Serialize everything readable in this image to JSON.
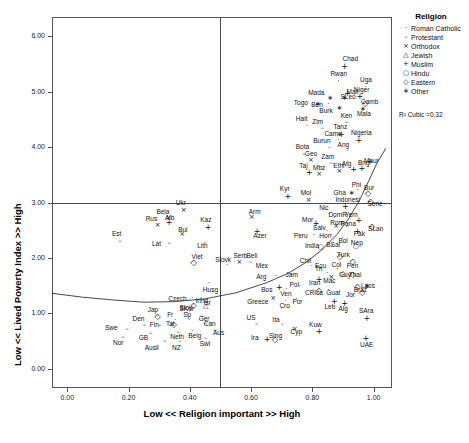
{
  "chart_data": {
    "type": "scatter",
    "title": "",
    "xlabel": "Low << Religion important >> High",
    "ylabel": "Low << Lived Poverty Index >> High",
    "xlim": [
      -0.05,
      1.06
    ],
    "ylim": [
      -0.35,
      6.35
    ],
    "xticks": [
      "0.00",
      "0.20",
      "0.40",
      "0.60",
      "0.80",
      "1.00"
    ],
    "xtickvals": [
      0.0,
      0.2,
      0.4,
      0.6,
      0.8,
      1.0
    ],
    "yticks": [
      "0.00",
      "1.00",
      "2.00",
      "3.00",
      "4.00",
      "5.00",
      "6.00"
    ],
    "ytickvals": [
      0.0,
      1.0,
      2.0,
      3.0,
      4.0,
      5.0,
      6.0
    ],
    "grid": false,
    "reference_lines": [
      {
        "axis": "y",
        "value": 3.0
      },
      {
        "axis": "x",
        "value": 0.5
      }
    ],
    "annotation": "R² Cubic =0.32",
    "fit": {
      "type": "cubic",
      "r2": 0.32
    },
    "legend": {
      "position": "top-right",
      "title": "Religion",
      "entries": [
        {
          "label": "Roman Catholic",
          "glyph": "·",
          "key": "catholic"
        },
        {
          "label": "Protestant",
          "glyph": "–",
          "key": "protestant"
        },
        {
          "label": "Orthodox",
          "glyph": "×",
          "key": "orthodox"
        },
        {
          "label": "Jewish",
          "glyph": "△",
          "key": "jewish"
        },
        {
          "label": "Muslim",
          "glyph": "+",
          "key": "muslim"
        },
        {
          "label": "Hindu",
          "glyph": "○",
          "key": "hindu"
        },
        {
          "label": "Eastern",
          "glyph": "◇",
          "key": "eastern"
        },
        {
          "label": "Other",
          "glyph": "∗",
          "key": "other"
        }
      ]
    },
    "points": [
      {
        "label": "Chad",
        "x": 0.905,
        "y": 5.46,
        "g": "muslim",
        "lx": 6,
        "ly": -8
      },
      {
        "label": "Rwan",
        "x": 0.885,
        "y": 5.19,
        "g": "catholic",
        "lx": 0,
        "ly": -8
      },
      {
        "label": "Uga",
        "x": 0.975,
        "y": 5.08,
        "g": "catholic",
        "lx": 2,
        "ly": -8
      },
      {
        "label": "Mali",
        "x": 0.915,
        "y": 4.97,
        "g": "muslim",
        "lx": 7,
        "ly": -2
      },
      {
        "label": "Niger",
        "x": 0.955,
        "y": 4.93,
        "g": "muslim",
        "lx": 2,
        "ly": -7
      },
      {
        "label": "Mada",
        "x": 0.858,
        "y": 4.88,
        "g": "other",
        "lx": -14,
        "ly": -6
      },
      {
        "label": "SLeo",
        "x": 0.905,
        "y": 4.88,
        "g": "other",
        "lx": 4,
        "ly": -2
      },
      {
        "label": "Togo",
        "x": 0.818,
        "y": 4.78,
        "g": "other",
        "lx": -16,
        "ly": -2
      },
      {
        "label": "Ben",
        "x": 0.852,
        "y": 4.78,
        "g": "catholic",
        "lx": -9,
        "ly": 0
      },
      {
        "label": "Camb",
        "x": 0.972,
        "y": 4.8,
        "g": "eastern",
        "lx": 4,
        "ly": -2
      },
      {
        "label": "Burk",
        "x": 0.888,
        "y": 4.7,
        "g": "other",
        "lx": -12,
        "ly": 2
      },
      {
        "label": "Mala",
        "x": 0.965,
        "y": 4.68,
        "g": "other",
        "lx": 2,
        "ly": 4
      },
      {
        "label": "Ken",
        "x": 0.912,
        "y": 4.45,
        "g": "protestant",
        "lx": 2,
        "ly": -7
      },
      {
        "label": "Hait",
        "x": 0.782,
        "y": 4.38,
        "g": "catholic",
        "lx": -3,
        "ly": -8
      },
      {
        "label": "Zim",
        "x": 0.832,
        "y": 4.34,
        "g": "protestant",
        "lx": -2,
        "ly": -7
      },
      {
        "label": "Tanz",
        "x": 0.895,
        "y": 4.23,
        "g": "muslim",
        "lx": 0,
        "ly": -8
      },
      {
        "label": "Came",
        "x": 0.885,
        "y": 4.12,
        "g": "catholic",
        "lx": -6,
        "ly": -7
      },
      {
        "label": "Nigeria",
        "x": 0.952,
        "y": 4.12,
        "g": "muslim",
        "lx": 0,
        "ly": -8
      },
      {
        "label": "Burun",
        "x": 0.855,
        "y": 3.98,
        "g": "catholic",
        "lx": -8,
        "ly": -8
      },
      {
        "label": "Ang",
        "x": 0.915,
        "y": 3.93,
        "g": "catholic",
        "lx": -2,
        "ly": -7
      },
      {
        "label": "Bota",
        "x": 0.772,
        "y": 3.88,
        "g": "protestant",
        "lx": 0,
        "ly": -8
      },
      {
        "label": "Geo",
        "x": 0.795,
        "y": 3.76,
        "g": "orthodox",
        "lx": 2,
        "ly": -7
      },
      {
        "label": "Zam",
        "x": 0.862,
        "y": 3.72,
        "g": "protestant",
        "lx": -2,
        "ly": -7
      },
      {
        "label": "Maur",
        "x": 0.988,
        "y": 3.75,
        "g": "muslim",
        "lx": 2,
        "ly": -1
      },
      {
        "label": "Taj",
        "x": 0.79,
        "y": 3.55,
        "g": "muslim",
        "lx": -2,
        "ly": -7
      },
      {
        "label": "Mbz",
        "x": 0.822,
        "y": 3.52,
        "g": "orthodox",
        "lx": 2,
        "ly": -7
      },
      {
        "label": "Ethi",
        "x": 0.888,
        "y": 3.57,
        "g": "orthodox",
        "lx": 2,
        "ly": -6
      },
      {
        "label": "Afg",
        "x": 0.935,
        "y": 3.6,
        "g": "muslim",
        "lx": -4,
        "ly": -6
      },
      {
        "label": "Bng",
        "x": 0.962,
        "y": 3.62,
        "g": "muslim",
        "lx": 4,
        "ly": -6
      },
      {
        "label": "Kyr",
        "x": 0.72,
        "y": 3.12,
        "g": "muslim",
        "lx": 0,
        "ly": -8
      },
      {
        "label": "Mol",
        "x": 0.788,
        "y": 3.04,
        "g": "orthodox",
        "lx": 0,
        "ly": -8
      },
      {
        "label": "Gha",
        "x": 0.928,
        "y": 3.18,
        "g": "other",
        "lx": -10,
        "ly": -1
      },
      {
        "label": "Phi",
        "x": 0.948,
        "y": 3.22,
        "g": "catholic",
        "lx": 2,
        "ly": -6
      },
      {
        "label": "Bur",
        "x": 0.982,
        "y": 3.18,
        "g": "eastern",
        "lx": 4,
        "ly": -6
      },
      {
        "label": "Sene",
        "x": 0.99,
        "y": 3.02,
        "g": "eastern",
        "lx": 5,
        "ly": 2
      },
      {
        "label": "Ukr",
        "x": 0.38,
        "y": 2.86,
        "g": "orthodox",
        "lx": 0,
        "ly": -8
      },
      {
        "label": "Arm",
        "x": 0.602,
        "y": 2.73,
        "g": "orthodox",
        "lx": 5,
        "ly": -6
      },
      {
        "label": "Indonesi",
        "x": 0.908,
        "y": 2.93,
        "g": "muslim",
        "lx": -2,
        "ly": -7
      },
      {
        "label": "Nic",
        "x": 0.855,
        "y": 2.8,
        "g": "catholic",
        "lx": -2,
        "ly": -7
      },
      {
        "label": "Bela",
        "x": 0.33,
        "y": 2.72,
        "g": "orthodox",
        "lx": -4,
        "ly": -7
      },
      {
        "label": "Rus",
        "x": 0.295,
        "y": 2.6,
        "g": "orthodox",
        "lx": -4,
        "ly": -7
      },
      {
        "label": "Alb",
        "x": 0.332,
        "y": 2.64,
        "g": "muslim",
        "lx": 4,
        "ly": -5
      },
      {
        "label": "DomR",
        "x": 0.872,
        "y": 2.72,
        "g": "catholic",
        "lx": 2,
        "ly": -4
      },
      {
        "label": "Yem",
        "x": 0.952,
        "y": 2.69,
        "g": "muslim",
        "lx": -6,
        "ly": -6
      },
      {
        "label": "Kaz",
        "x": 0.46,
        "y": 2.56,
        "g": "muslim",
        "lx": 0,
        "ly": -8
      },
      {
        "label": "Mor",
        "x": 0.812,
        "y": 2.63,
        "g": "muslim",
        "lx": -6,
        "ly": -4
      },
      {
        "label": "Rom",
        "x": 0.878,
        "y": 2.58,
        "g": "orthodox",
        "lx": 2,
        "ly": -4
      },
      {
        "label": "Pana",
        "x": 0.912,
        "y": 2.55,
        "g": "catholic",
        "lx": 2,
        "ly": -4
      },
      {
        "label": "Azer",
        "x": 0.62,
        "y": 2.49,
        "g": "muslim",
        "lx": 4,
        "ly": 4
      },
      {
        "label": "Bul",
        "x": 0.375,
        "y": 2.43,
        "g": "orthodox",
        "lx": 4,
        "ly": -5
      },
      {
        "label": "SLan",
        "x": 0.995,
        "y": 2.58,
        "g": "eastern",
        "lx": 4,
        "ly": 2
      },
      {
        "label": "Salv",
        "x": 0.848,
        "y": 2.48,
        "g": "catholic",
        "lx": -6,
        "ly": -4
      },
      {
        "label": "Pak",
        "x": 0.948,
        "y": 2.49,
        "g": "muslim",
        "lx": 4,
        "ly": 2
      },
      {
        "label": "Est",
        "x": 0.172,
        "y": 2.31,
        "g": "protestant",
        "lx": 0,
        "ly": -8
      },
      {
        "label": "Peru",
        "x": 0.805,
        "y": 2.42,
        "g": "catholic",
        "lx": -12,
        "ly": 0
      },
      {
        "label": "Hon",
        "x": 0.862,
        "y": 2.42,
        "g": "catholic",
        "lx": -4,
        "ly": 0
      },
      {
        "label": "Bol",
        "x": 0.898,
        "y": 2.36,
        "g": "catholic",
        "lx": 4,
        "ly": 2
      },
      {
        "label": "Lat",
        "x": 0.332,
        "y": 2.27,
        "g": "protestant",
        "lx": -9,
        "ly": 0
      },
      {
        "label": "Lith",
        "x": 0.45,
        "y": 2.27,
        "g": "catholic",
        "lx": 0,
        "ly": 2
      },
      {
        "label": "India",
        "x": 0.828,
        "y": 2.2,
        "g": "hindu",
        "lx": -8,
        "ly": -2
      },
      {
        "label": "BSal",
        "x": 0.865,
        "y": 2.22,
        "g": "catholic",
        "lx": 2,
        "ly": -2
      },
      {
        "label": "Nep",
        "x": 0.942,
        "y": 2.21,
        "g": "hindu",
        "lx": 3,
        "ly": -4
      },
      {
        "label": "Viet",
        "x": 0.412,
        "y": 1.92,
        "g": "eastern",
        "lx": 6,
        "ly": -6
      },
      {
        "label": "Turk",
        "x": 0.89,
        "y": 2.04,
        "g": "eastern",
        "lx": 5,
        "ly": -2
      },
      {
        "label": "Slovk",
        "x": 0.522,
        "y": 1.87,
        "g": "catholic",
        "lx": -4,
        "ly": -6
      },
      {
        "label": "Serb",
        "x": 0.562,
        "y": 1.92,
        "g": "orthodox",
        "lx": 2,
        "ly": -7
      },
      {
        "label": "Beli",
        "x": 0.598,
        "y": 1.92,
        "g": "protestant",
        "lx": 4,
        "ly": -7
      },
      {
        "label": "Pen",
        "x": 0.932,
        "y": 1.94,
        "g": "eastern",
        "lx": 2,
        "ly": 4
      },
      {
        "label": "Chil",
        "x": 0.798,
        "y": 1.85,
        "g": "catholic",
        "lx": -4,
        "ly": -6
      },
      {
        "label": "Ecu",
        "x": 0.828,
        "y": 1.8,
        "g": "catholic",
        "lx": 2,
        "ly": -4
      },
      {
        "label": "Mex",
        "x": 0.648,
        "y": 1.82,
        "g": "catholic",
        "lx": -2,
        "ly": -3
      },
      {
        "label": "Col",
        "x": 0.882,
        "y": 1.8,
        "g": "catholic",
        "lx": 2,
        "ly": -5
      },
      {
        "label": "Tri",
        "x": 0.848,
        "y": 1.72,
        "g": "catholic",
        "lx": -4,
        "ly": -5
      },
      {
        "label": "Mac",
        "x": 0.862,
        "y": 1.66,
        "g": "orthodox",
        "lx": 0,
        "ly": 3
      },
      {
        "label": "Guy",
        "x": 0.9,
        "y": 1.7,
        "g": "hindu",
        "lx": 4,
        "ly": 0
      },
      {
        "label": "Thai",
        "x": 0.932,
        "y": 1.7,
        "g": "eastern",
        "lx": 4,
        "ly": 0
      },
      {
        "label": "Arg",
        "x": 0.682,
        "y": 1.68,
        "g": "catholic",
        "lx": -12,
        "ly": 0
      },
      {
        "label": "Jam",
        "x": 0.732,
        "y": 1.7,
        "g": "protestant",
        "lx": 2,
        "ly": 0
      },
      {
        "label": "Iran",
        "x": 0.822,
        "y": 1.62,
        "g": "muslim",
        "lx": -2,
        "ly": 3
      },
      {
        "label": "Husg",
        "x": 0.462,
        "y": 1.55,
        "g": "catholic",
        "lx": 2,
        "ly": 6
      },
      {
        "label": "Bos",
        "x": 0.692,
        "y": 1.47,
        "g": "muslim",
        "lx": -10,
        "ly": 2
      },
      {
        "label": "Ven",
        "x": 0.715,
        "y": 1.44,
        "g": "catholic",
        "lx": 2,
        "ly": 4
      },
      {
        "label": "Pol",
        "x": 0.758,
        "y": 1.5,
        "g": "catholic",
        "lx": -2,
        "ly": -2
      },
      {
        "label": "Braz",
        "x": 0.948,
        "y": 1.5,
        "g": "eastern",
        "lx": 4,
        "ly": 3
      },
      {
        "label": "Laos",
        "x": 0.978,
        "y": 1.5,
        "g": "other",
        "lx": 2,
        "ly": -1
      },
      {
        "label": "CRica",
        "x": 0.822,
        "y": 1.42,
        "g": "eastern",
        "lx": -6,
        "ly": 2
      },
      {
        "label": "Guat",
        "x": 0.852,
        "y": 1.42,
        "g": "catholic",
        "lx": 6,
        "ly": 2
      },
      {
        "label": "Jor",
        "x": 0.962,
        "y": 1.38,
        "g": "eastern",
        "lx": -8,
        "ly": 2
      },
      {
        "label": "Czech",
        "x": 0.408,
        "y": 1.28,
        "g": "catholic",
        "lx": -16,
        "ly": 0
      },
      {
        "label": "Irlnd",
        "x": 0.438,
        "y": 1.28,
        "g": "catholic",
        "lx": 2,
        "ly": 2
      },
      {
        "label": "Greece",
        "x": 0.672,
        "y": 1.28,
        "g": "orthodox",
        "lx": -18,
        "ly": 3
      },
      {
        "label": "Cro",
        "x": 0.712,
        "y": 1.22,
        "g": "catholic",
        "lx": 2,
        "ly": 4
      },
      {
        "label": "Por",
        "x": 0.748,
        "y": 1.26,
        "g": "catholic",
        "lx": 4,
        "ly": 2
      },
      {
        "label": "Leb",
        "x": 0.872,
        "y": 1.22,
        "g": "muslim",
        "lx": -2,
        "ly": 5
      },
      {
        "label": "Alg",
        "x": 0.905,
        "y": 1.18,
        "g": "muslim",
        "lx": 2,
        "ly": 5
      },
      {
        "label": "SKor",
        "x": 0.412,
        "y": 1.15,
        "g": "eastern",
        "lx": -6,
        "ly": 3
      },
      {
        "label": "Isr",
        "x": 0.452,
        "y": 1.13,
        "g": "jewish",
        "lx": 6,
        "ly": -4
      },
      {
        "label": "Jap",
        "x": 0.295,
        "y": 0.95,
        "g": "eastern",
        "lx": -2,
        "ly": -7
      },
      {
        "label": "Slov",
        "x": 0.392,
        "y": 1.0,
        "g": "catholic",
        "lx": 0,
        "ly": -6
      },
      {
        "label": "Ger",
        "x": 0.442,
        "y": 0.95,
        "g": "protestant",
        "lx": 4,
        "ly": 2
      },
      {
        "label": "Fr",
        "x": 0.352,
        "y": 0.88,
        "g": "catholic",
        "lx": 0,
        "ly": -6
      },
      {
        "label": "Sp",
        "x": 0.398,
        "y": 0.88,
        "g": "catholic",
        "lx": 2,
        "ly": -6
      },
      {
        "label": "Can",
        "x": 0.452,
        "y": 0.82,
        "g": "protestant",
        "lx": 6,
        "ly": 0
      },
      {
        "label": "SAra",
        "x": 0.978,
        "y": 0.92,
        "g": "muslim",
        "lx": 0,
        "ly": -8
      },
      {
        "label": "US",
        "x": 0.618,
        "y": 0.8,
        "g": "protestant",
        "lx": -2,
        "ly": -7
      },
      {
        "label": "Den",
        "x": 0.252,
        "y": 0.78,
        "g": "protestant",
        "lx": -4,
        "ly": -7
      },
      {
        "label": "Fin",
        "x": 0.302,
        "y": 0.78,
        "g": "protestant",
        "lx": -2,
        "ly": -1
      },
      {
        "label": "Tai",
        "x": 0.348,
        "y": 0.8,
        "g": "eastern",
        "lx": 0,
        "ly": -1
      },
      {
        "label": "Ita",
        "x": 0.702,
        "y": 0.78,
        "g": "catholic",
        "lx": -2,
        "ly": -6
      },
      {
        "label": "Cyp",
        "x": 0.742,
        "y": 0.72,
        "g": "orthodox",
        "lx": 4,
        "ly": 2
      },
      {
        "label": "Swe",
        "x": 0.195,
        "y": 0.72,
        "g": "protestant",
        "lx": -14,
        "ly": -2
      },
      {
        "label": "Aus",
        "x": 0.482,
        "y": 0.7,
        "g": "protestant",
        "lx": 6,
        "ly": 2
      },
      {
        "label": "Kuw",
        "x": 0.822,
        "y": 0.68,
        "g": "muslim",
        "lx": -2,
        "ly": -7
      },
      {
        "label": "GB",
        "x": 0.272,
        "y": 0.64,
        "g": "protestant",
        "lx": -4,
        "ly": 4
      },
      {
        "label": "Neth",
        "x": 0.362,
        "y": 0.66,
        "g": "protestant",
        "lx": 0,
        "ly": 4
      },
      {
        "label": "Belg",
        "x": 0.408,
        "y": 0.68,
        "g": "catholic",
        "lx": 4,
        "ly": 4
      },
      {
        "label": "Nor",
        "x": 0.182,
        "y": 0.58,
        "g": "protestant",
        "lx": -2,
        "ly": 5
      },
      {
        "label": "Swi",
        "x": 0.452,
        "y": 0.56,
        "g": "protestant",
        "lx": 2,
        "ly": 5
      },
      {
        "label": "Ira",
        "x": 0.652,
        "y": 0.54,
        "g": "muslim",
        "lx": -8,
        "ly": -2
      },
      {
        "label": "Sing",
        "x": 0.678,
        "y": 0.54,
        "g": "eastern",
        "lx": 2,
        "ly": -4
      },
      {
        "label": "UAE",
        "x": 0.975,
        "y": 0.55,
        "g": "muslim",
        "lx": 2,
        "ly": 6
      },
      {
        "label": "Ausli",
        "x": 0.318,
        "y": 0.5,
        "g": "protestant",
        "lx": -12,
        "ly": 6
      },
      {
        "label": "NZ",
        "x": 0.368,
        "y": 0.5,
        "g": "protestant",
        "lx": 0,
        "ly": 6
      }
    ],
    "fit_path": [
      {
        "x": -0.05,
        "y": 1.36
      },
      {
        "x": 0.05,
        "y": 1.29
      },
      {
        "x": 0.15,
        "y": 1.24
      },
      {
        "x": 0.25,
        "y": 1.2
      },
      {
        "x": 0.35,
        "y": 1.21
      },
      {
        "x": 0.45,
        "y": 1.26
      },
      {
        "x": 0.55,
        "y": 1.37
      },
      {
        "x": 0.65,
        "y": 1.55
      },
      {
        "x": 0.72,
        "y": 1.72
      },
      {
        "x": 0.78,
        "y": 1.92
      },
      {
        "x": 0.83,
        "y": 2.14
      },
      {
        "x": 0.88,
        "y": 2.42
      },
      {
        "x": 0.92,
        "y": 2.72
      },
      {
        "x": 0.955,
        "y": 3.05
      },
      {
        "x": 0.985,
        "y": 3.4
      },
      {
        "x": 1.01,
        "y": 3.7
      },
      {
        "x": 1.04,
        "y": 3.98
      }
    ]
  }
}
